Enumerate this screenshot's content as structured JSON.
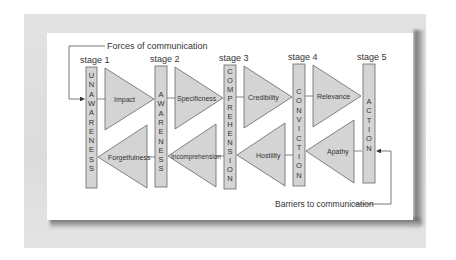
{
  "diagram": {
    "title_top": "Forces of communication",
    "title_bottom": "Barriers to communication",
    "colors": {
      "fill": "#d4d4d4",
      "stroke": "#666666",
      "text": "#333333"
    },
    "stages": [
      {
        "label": "stage 1",
        "name": "UNAWARENESS"
      },
      {
        "label": "stage 2",
        "name": "AWARENESS"
      },
      {
        "label": "stage 3",
        "name": "COMPREHENSION"
      },
      {
        "label": "stage 4",
        "name": "CONVICTION"
      },
      {
        "label": "stage 5",
        "name": "ACTION"
      }
    ],
    "forces": [
      "Impact",
      "Specificness",
      "Credibility",
      "Relevance"
    ],
    "barriers": [
      "Forgetfulness",
      "Incomprehension",
      "Hostility",
      "Apathy"
    ]
  }
}
